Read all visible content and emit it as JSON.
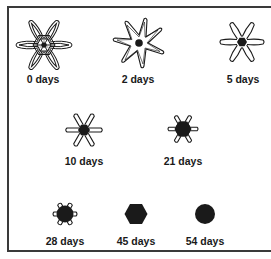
{
  "figure": {
    "stages": [
      {
        "label": "0 days",
        "cx": 43,
        "cy": 45,
        "form": "star-with-hexagon-lattice"
      },
      {
        "label": "2 days",
        "cx": 138,
        "cy": 42,
        "form": "star-outline-with-dot"
      },
      {
        "label": "5 days",
        "cx": 242,
        "cy": 42,
        "form": "star-arms-with-hexagon"
      },
      {
        "label": "10 days",
        "cx": 84,
        "cy": 129,
        "form": "thin-arms-with-hexagon"
      },
      {
        "label": "21 days",
        "cx": 183,
        "cy": 129,
        "form": "short-arms-large-hexagon"
      },
      {
        "label": "28 days",
        "cx": 65,
        "cy": 214,
        "form": "stub-arms-large-hexagon"
      },
      {
        "label": "45 days",
        "cx": 136,
        "cy": 214,
        "form": "filled-hexagon"
      },
      {
        "label": "54 days",
        "cx": 205,
        "cy": 214,
        "form": "filled-circle"
      }
    ]
  },
  "colors": {
    "ink": "#1a1a1a",
    "border": "#3a3a3a",
    "background": "#ffffff"
  }
}
